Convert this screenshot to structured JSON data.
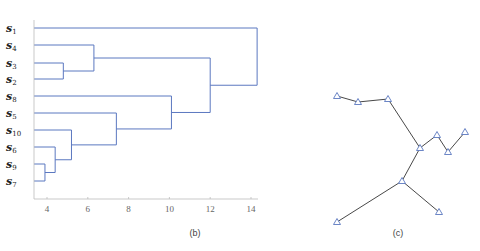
{
  "panel_b": {
    "caption": "(b)",
    "leaves": [
      {
        "id": "s1",
        "base": "s",
        "sub": "1",
        "y": 28
      },
      {
        "id": "s4",
        "base": "s",
        "sub": "4",
        "y": 45
      },
      {
        "id": "s3",
        "base": "s",
        "sub": "3",
        "y": 63
      },
      {
        "id": "s2",
        "base": "s",
        "sub": "2",
        "y": 79
      },
      {
        "id": "s8",
        "base": "s",
        "sub": "8",
        "y": 96
      },
      {
        "id": "s5",
        "base": "s",
        "sub": "5",
        "y": 113
      },
      {
        "id": "s10",
        "base": "s",
        "sub": "10",
        "y": 130
      },
      {
        "id": "s6",
        "base": "s",
        "sub": "6",
        "y": 147
      },
      {
        "id": "s9",
        "base": "s",
        "sub": "9",
        "y": 164
      },
      {
        "id": "s7",
        "base": "s",
        "sub": "7",
        "y": 181
      }
    ],
    "x_ticks": [
      "4",
      "6",
      "8",
      "10",
      "12",
      "14"
    ],
    "line_color": "#5b78c0"
  },
  "panel_c": {
    "caption": "(c)",
    "node_color": "#5b78c0",
    "edge_color": "#333333"
  },
  "chart_data": {
    "type": "dendrogram",
    "title": "",
    "xlabel": "",
    "ylabel": "",
    "xlim": [
      3.4,
      14.8
    ],
    "x_ticks": [
      4,
      6,
      8,
      10,
      12,
      14
    ],
    "leaf_order": [
      "s1",
      "s4",
      "s3",
      "s2",
      "s8",
      "s5",
      "s10",
      "s6",
      "s9",
      "s7"
    ],
    "merges": [
      {
        "children": [
          "s9",
          "s7"
        ],
        "height": 3.9
      },
      {
        "children": [
          "s6",
          "(s9,s7)"
        ],
        "height": 4.4
      },
      {
        "children": [
          "s10",
          "(s6,s9,s7)"
        ],
        "height": 5.2
      },
      {
        "children": [
          "s3",
          "s2"
        ],
        "height": 4.8
      },
      {
        "children": [
          "s4",
          "(s3,s2)"
        ],
        "height": 6.3
      },
      {
        "children": [
          "s5",
          "(s10,s6,s9,s7)"
        ],
        "height": 7.4
      },
      {
        "children": [
          "s8",
          "(s5,...)"
        ],
        "height": 10.1
      },
      {
        "children": [
          "(s4,s3,s2)",
          "(s8,...)"
        ],
        "height": 12.0
      },
      {
        "children": [
          "s1",
          "(rest)"
        ],
        "height": 14.3
      }
    ],
    "graph_panel": {
      "nodes": [
        [
          337,
          96
        ],
        [
          358,
          102
        ],
        [
          388,
          99
        ],
        [
          420,
          148
        ],
        [
          437,
          135
        ],
        [
          448,
          152
        ],
        [
          465,
          132
        ],
        [
          402,
          181
        ],
        [
          337,
          222
        ],
        [
          439,
          212
        ]
      ],
      "edges": [
        [
          0,
          1
        ],
        [
          1,
          2
        ],
        [
          2,
          3
        ],
        [
          3,
          4
        ],
        [
          4,
          5
        ],
        [
          5,
          6
        ],
        [
          3,
          7
        ],
        [
          7,
          8
        ],
        [
          7,
          9
        ]
      ]
    }
  }
}
